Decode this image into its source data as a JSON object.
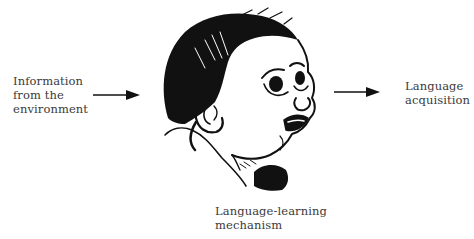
{
  "diagram": {
    "input_label": {
      "lines": [
        "Information",
        "from the",
        "environment"
      ]
    },
    "output_label": {
      "lines": [
        "Language",
        "acquisition"
      ]
    },
    "mechanism_label": {
      "lines": [
        "Language-learning",
        "mechanism"
      ]
    },
    "icons": {
      "left_arrow": "arrow-right-icon",
      "right_arrow": "arrow-right-icon",
      "center_figure": "baby-head-illustration"
    },
    "colors": {
      "text": "#3a3a3a",
      "ink": "#111111",
      "background": "#ffffff"
    }
  }
}
